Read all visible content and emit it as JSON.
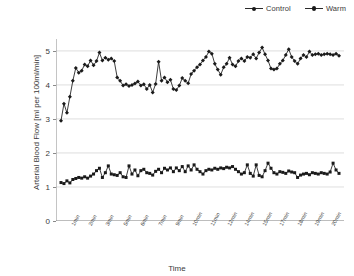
{
  "legend": {
    "position": "top-right",
    "entries": [
      {
        "label": "Control",
        "marker": "square-small",
        "color": "#1a1a1a"
      },
      {
        "label": "Warm",
        "marker": "diamond",
        "color": "#1a1a1a"
      }
    ]
  },
  "axes": {
    "ylabel": "Arterial Blood Flow [ml per 100ml/min]",
    "xlabel": "Time",
    "yticks": [
      0,
      1,
      2,
      3,
      4,
      5
    ],
    "ylim": [
      0,
      5.35
    ],
    "grid": "horizontal",
    "xticks": [
      "1min",
      "2min",
      "3min",
      "5min",
      "6min",
      "7min",
      "9min",
      "10min",
      "11min",
      "12min",
      "14min",
      "15min",
      "17min",
      "18min",
      "19min",
      "20min"
    ]
  },
  "chart_data": {
    "type": "line",
    "title": "",
    "xlabel": "Time",
    "ylabel": "Arterial Blood Flow [ml per 100ml/min]",
    "ylim": [
      0,
      5.35
    ],
    "grid": true,
    "legend_position": "top-right",
    "x_tick_labels": [
      "1min",
      "2min",
      "3min",
      "5min",
      "6min",
      "7min",
      "9min",
      "10min",
      "11min",
      "12min",
      "14min",
      "15min",
      "17min",
      "18min",
      "19min",
      "20min"
    ],
    "n_points": 95,
    "series": [
      {
        "name": "Warm",
        "color": "#1a1a1a",
        "marker": "diamond",
        "values": [
          2.95,
          3.45,
          3.18,
          3.65,
          4.12,
          4.5,
          4.36,
          4.42,
          4.6,
          4.55,
          4.72,
          4.58,
          4.7,
          4.95,
          4.72,
          4.8,
          4.74,
          4.78,
          4.7,
          4.22,
          4.12,
          3.98,
          4.02,
          3.97,
          4.0,
          4.04,
          4.1,
          3.98,
          4.02,
          3.88,
          4.0,
          3.78,
          4.03,
          4.68,
          4.12,
          4.22,
          4.08,
          4.15,
          3.88,
          3.85,
          3.98,
          4.2,
          4.12,
          4.05,
          4.32,
          4.42,
          4.52,
          4.6,
          4.72,
          4.82,
          4.98,
          4.92,
          4.62,
          4.45,
          4.3,
          4.52,
          4.62,
          4.8,
          4.6,
          4.55,
          4.7,
          4.78,
          4.7,
          4.82,
          4.8,
          4.9,
          4.78,
          4.95,
          5.1,
          4.9,
          4.72,
          4.48,
          4.45,
          4.48,
          4.62,
          4.72,
          4.88,
          5.05,
          4.82,
          4.7,
          4.62,
          4.78,
          4.88,
          4.82,
          4.98,
          4.88,
          4.9,
          4.92,
          4.88,
          4.9,
          4.92,
          4.9,
          4.88,
          4.92,
          4.86
        ]
      },
      {
        "name": "Control",
        "color": "#1a1a1a",
        "marker": "square-small",
        "values": [
          1.13,
          1.1,
          1.18,
          1.12,
          1.22,
          1.25,
          1.28,
          1.26,
          1.3,
          1.26,
          1.32,
          1.38,
          1.48,
          1.55,
          1.28,
          1.42,
          1.62,
          1.38,
          1.36,
          1.34,
          1.42,
          1.3,
          1.28,
          1.62,
          1.38,
          1.5,
          1.33,
          1.48,
          1.52,
          1.42,
          1.4,
          1.35,
          1.46,
          1.52,
          1.42,
          1.55,
          1.5,
          1.56,
          1.45,
          1.56,
          1.48,
          1.6,
          1.45,
          1.62,
          1.5,
          1.65,
          1.52,
          1.45,
          1.38,
          1.48,
          1.52,
          1.5,
          1.55,
          1.52,
          1.56,
          1.54,
          1.58,
          1.56,
          1.6,
          1.52,
          1.45,
          1.38,
          1.42,
          1.65,
          1.4,
          1.32,
          1.65,
          1.34,
          1.3,
          1.48,
          1.7,
          1.55,
          1.42,
          1.38,
          1.45,
          1.43,
          1.4,
          1.47,
          1.44,
          1.42,
          1.28,
          1.35,
          1.38,
          1.4,
          1.36,
          1.42,
          1.4,
          1.38,
          1.42,
          1.4,
          1.38,
          1.44,
          1.7,
          1.5,
          1.4
        ]
      }
    ]
  }
}
